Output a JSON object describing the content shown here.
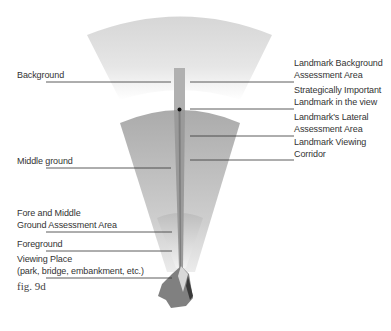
{
  "figure": {
    "caption": "fig. 9d",
    "colors": {
      "background_zone": "#d9d9d9",
      "middle_zone": "#b3b3b3",
      "fore_zone": "#a6a6a6",
      "corridor": "#a0a0a0",
      "corridor_dark": "#808080",
      "leader_line": "#333333",
      "viewing_place": "#7a7a7a"
    }
  },
  "labels_left": [
    {
      "text": "Background"
    },
    {
      "text": "Middle ground"
    },
    {
      "text": "Fore and Middle\nGround Assessment Area",
      "line1": "Fore and Middle",
      "line2": "Ground Assessment Area"
    },
    {
      "text": "Foreground"
    },
    {
      "text": "Viewing Place\n(park, bridge, embankment, etc.)",
      "line1": "Viewing Place",
      "line2": "(park, bridge, embankment, etc.)"
    }
  ],
  "labels_right": [
    {
      "line1": "Landmark Background",
      "line2": "Assessment Area"
    },
    {
      "line1": "Strategically Important",
      "line2": "Landmark in the view"
    },
    {
      "line1": "Landmark's Lateral",
      "line2": "Assessment Area"
    },
    {
      "line1": "Landmark Viewing",
      "line2": "Corridor"
    }
  ]
}
